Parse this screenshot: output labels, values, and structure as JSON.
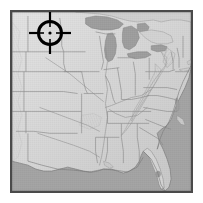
{
  "image": {
    "kind": "relief-map",
    "title": "Eastern and Central United States Relief Map",
    "alt_text": "Grayscale shaded-relief map of the eastern and central United States with state outlines and a crosshair target marker over the upper Midwest",
    "width": 203,
    "height": 203,
    "colorspace": "grayscale"
  },
  "frame": {
    "margin_px": 10,
    "border_px": 2,
    "border_color": "#4a4a4a",
    "background_color": "#ffffff"
  },
  "palette": {
    "ocean": "#a3a3a3",
    "lake": "#9e9e9e",
    "land_light": "#dcdcdc",
    "land_mid": "#cbcbcb",
    "land_shadow": "#b4b4b4",
    "state_border": "#8a8a8a",
    "coastline": "#7d7d7d",
    "relief_highlight": "#efefef",
    "marker": "#000000"
  },
  "marker": {
    "type": "crosshair-target-reticle",
    "label": "Target marker",
    "center_x": 50,
    "center_y": 33,
    "ring_outer_radius": 13,
    "ring_stroke": 3,
    "tick_length": 9,
    "center_dot_radius": 1.6,
    "color": "#000000",
    "region_indicated": "Upper Midwest"
  },
  "features": {
    "water_bodies": [
      "Atlantic Ocean",
      "Gulf of Mexico",
      "Lake Superior",
      "Lake Michigan",
      "Lake Huron",
      "Lake Erie",
      "Lake Ontario"
    ],
    "landmarks": [
      "Florida Peninsula",
      "Appalachian Mountains",
      "Great Plains",
      "Mississippi River Valley",
      "Chesapeake Bay",
      "Gulf Coast"
    ],
    "shows_state_boundaries": true,
    "shows_shaded_relief": true
  }
}
